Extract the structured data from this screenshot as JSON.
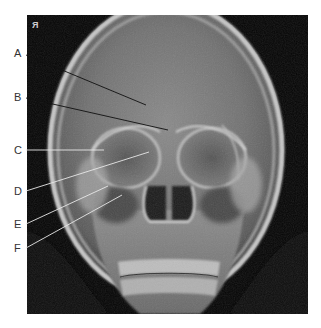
{
  "figure": {
    "side_marker": "R",
    "side_marker_display": "Я",
    "labels": [
      {
        "id": "A",
        "text": "A"
      },
      {
        "id": "B",
        "text": "B"
      },
      {
        "id": "C",
        "text": "C"
      },
      {
        "id": "D",
        "text": "D"
      },
      {
        "id": "E",
        "text": "E"
      },
      {
        "id": "F",
        "text": "F"
      }
    ]
  },
  "colors": {
    "background": "#ffffff",
    "label_text": "#333333",
    "leader_line_dark": "#111111",
    "leader_line_light": "#e8e8e8",
    "film_black": "#050505"
  }
}
